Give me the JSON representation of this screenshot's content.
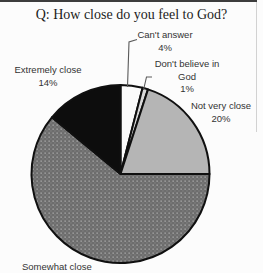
{
  "title": "Q: How close do you feel to God?",
  "chart_data": {
    "type": "pie",
    "title": "Q: How close do you feel to God?",
    "direction": "clockwise",
    "start_angle_deg": 0,
    "legend": "none",
    "slices": [
      {
        "label": "Can't answer",
        "pct_label": "4%",
        "value": 4,
        "color": "#fbfbfb"
      },
      {
        "label": "Don't believe in God",
        "pct_label": "1%",
        "value": 1,
        "color": "#d9d9d9"
      },
      {
        "label": "Not very close",
        "pct_label": "20%",
        "value": 20,
        "color": "#b5b5b5"
      },
      {
        "label": "Somewhat close",
        "pct_label": "",
        "value": 61,
        "color": "pattern:dots"
      },
      {
        "label": "Extremely close",
        "pct_label": "14%",
        "value": 14,
        "color": "#0d0d0d"
      }
    ]
  },
  "labels": {
    "cant_answer": {
      "text": "Can't answer",
      "pct": "4%"
    },
    "dont_believe": {
      "line1": "Don't believe in",
      "line2": "God",
      "pct": "1%"
    },
    "not_very_close": {
      "text": "Not very close",
      "pct": "20%"
    },
    "extremely_close": {
      "text": "Extremely close",
      "pct": "14%"
    },
    "somewhat_close": {
      "text": "Somewhat close"
    }
  }
}
